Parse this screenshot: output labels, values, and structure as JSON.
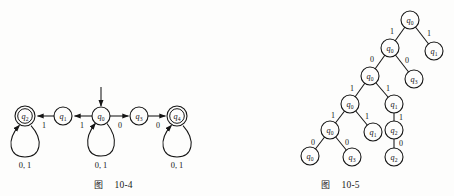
{
  "page": {
    "background": "#fdfdfc",
    "ink": "#151515",
    "width": 454,
    "height": 196
  },
  "figures": [
    {
      "id": "automaton",
      "caption_cjk": "图",
      "caption_number": "10-4"
    },
    {
      "id": "tree",
      "caption_cjk": "图",
      "caption_number": "10-5"
    }
  ],
  "automaton": {
    "caption_cjk": "图",
    "caption_number": "10-4",
    "start_state": "q0",
    "states": [
      {
        "id": "q2",
        "label": "q",
        "sub": "2",
        "cx": 25,
        "cy": 116,
        "r": 10,
        "accepting": true,
        "has_self_loop": true,
        "loop_label": "0, 1"
      },
      {
        "id": "q1",
        "label": "q",
        "sub": "1",
        "cx": 63,
        "cy": 116,
        "r": 9,
        "accepting": false,
        "has_self_loop": false,
        "loop_label": ""
      },
      {
        "id": "q0",
        "label": "q",
        "sub": "0",
        "cx": 101,
        "cy": 116,
        "r": 9,
        "accepting": false,
        "has_self_loop": true,
        "loop_label": "0, 1"
      },
      {
        "id": "q3",
        "label": "q",
        "sub": "3",
        "cx": 139,
        "cy": 116,
        "r": 9,
        "accepting": false,
        "has_self_loop": false,
        "loop_label": ""
      },
      {
        "id": "q4",
        "label": "q",
        "sub": "4",
        "cx": 177,
        "cy": 116,
        "r": 10,
        "accepting": true,
        "has_self_loop": true,
        "loop_label": "0, 1"
      }
    ],
    "transitions": [
      {
        "from": "q1",
        "to": "q2",
        "symbol": "1",
        "lx": 44,
        "ly": 127
      },
      {
        "from": "q0",
        "to": "q1",
        "symbol": "1",
        "lx": 82,
        "ly": 127
      },
      {
        "from": "q0",
        "to": "q3",
        "symbol": "0",
        "lx": 120,
        "ly": 127
      },
      {
        "from": "q3",
        "to": "q4",
        "symbol": "0",
        "lx": 158,
        "ly": 127
      }
    ],
    "self_loop_labels": [
      {
        "state": "q2",
        "text": "0, 1",
        "lx": 25,
        "ly": 163
      },
      {
        "state": "q0",
        "text": "0, 1",
        "lx": 101,
        "ly": 163
      },
      {
        "state": "q4",
        "text": "0, 1",
        "lx": 177,
        "ly": 163
      }
    ]
  },
  "tree": {
    "caption_cjk": "图",
    "caption_number": "10-5",
    "nodes": [
      {
        "id": "n0",
        "label": "q",
        "sub": "0",
        "cx": 410,
        "cy": 20,
        "r": 9
      },
      {
        "id": "n1",
        "label": "q",
        "sub": "0",
        "cx": 390,
        "cy": 48,
        "r": 9
      },
      {
        "id": "n2",
        "label": "q",
        "sub": "1",
        "cx": 434,
        "cy": 51,
        "r": 9
      },
      {
        "id": "n3",
        "label": "q",
        "sub": "0",
        "cx": 370,
        "cy": 76,
        "r": 9
      },
      {
        "id": "n4",
        "label": "q",
        "sub": "3",
        "cx": 414,
        "cy": 79,
        "r": 9
      },
      {
        "id": "n5",
        "label": "q",
        "sub": "0",
        "cx": 350,
        "cy": 104,
        "r": 9
      },
      {
        "id": "n6",
        "label": "q",
        "sub": "1",
        "cx": 394,
        "cy": 104,
        "r": 9
      },
      {
        "id": "n7",
        "label": "q",
        "sub": "0",
        "cx": 330,
        "cy": 130,
        "r": 9
      },
      {
        "id": "n8",
        "label": "q",
        "sub": "1",
        "cx": 373,
        "cy": 132,
        "r": 9
      },
      {
        "id": "n9",
        "label": "q",
        "sub": "2",
        "cx": 394,
        "cy": 130,
        "r": 9
      },
      {
        "id": "n10",
        "label": "q",
        "sub": "0",
        "cx": 310,
        "cy": 156,
        "r": 9
      },
      {
        "id": "n11",
        "label": "q",
        "sub": "3",
        "cx": 352,
        "cy": 157,
        "r": 9
      },
      {
        "id": "n12",
        "label": "q",
        "sub": "2",
        "cx": 394,
        "cy": 157,
        "r": 9
      }
    ],
    "edges": [
      {
        "from": "n0",
        "to": "n1",
        "symbol": "1",
        "lx": 392,
        "ly": 31
      },
      {
        "from": "n0",
        "to": "n2",
        "symbol": "1",
        "lx": 429,
        "ly": 33
      },
      {
        "from": "n1",
        "to": "n3",
        "symbol": "0",
        "lx": 372,
        "ly": 59
      },
      {
        "from": "n1",
        "to": "n4",
        "symbol": "0",
        "lx": 408,
        "ly": 60
      },
      {
        "from": "n3",
        "to": "n5",
        "symbol": "1",
        "lx": 352,
        "ly": 88
      },
      {
        "from": "n3",
        "to": "n6",
        "symbol": "1",
        "lx": 388,
        "ly": 88
      },
      {
        "from": "n5",
        "to": "n7",
        "symbol": "1",
        "lx": 332,
        "ly": 115
      },
      {
        "from": "n5",
        "to": "n8",
        "symbol": "1",
        "lx": 368,
        "ly": 116
      },
      {
        "from": "n6",
        "to": "n9",
        "symbol": "1",
        "lx": 400,
        "ly": 118
      },
      {
        "from": "n7",
        "to": "n10",
        "symbol": "0",
        "lx": 312,
        "ly": 142
      },
      {
        "from": "n7",
        "to": "n11",
        "symbol": "0",
        "lx": 348,
        "ly": 142
      },
      {
        "from": "n9",
        "to": "n12",
        "symbol": "0",
        "lx": 400,
        "ly": 144
      }
    ]
  }
}
